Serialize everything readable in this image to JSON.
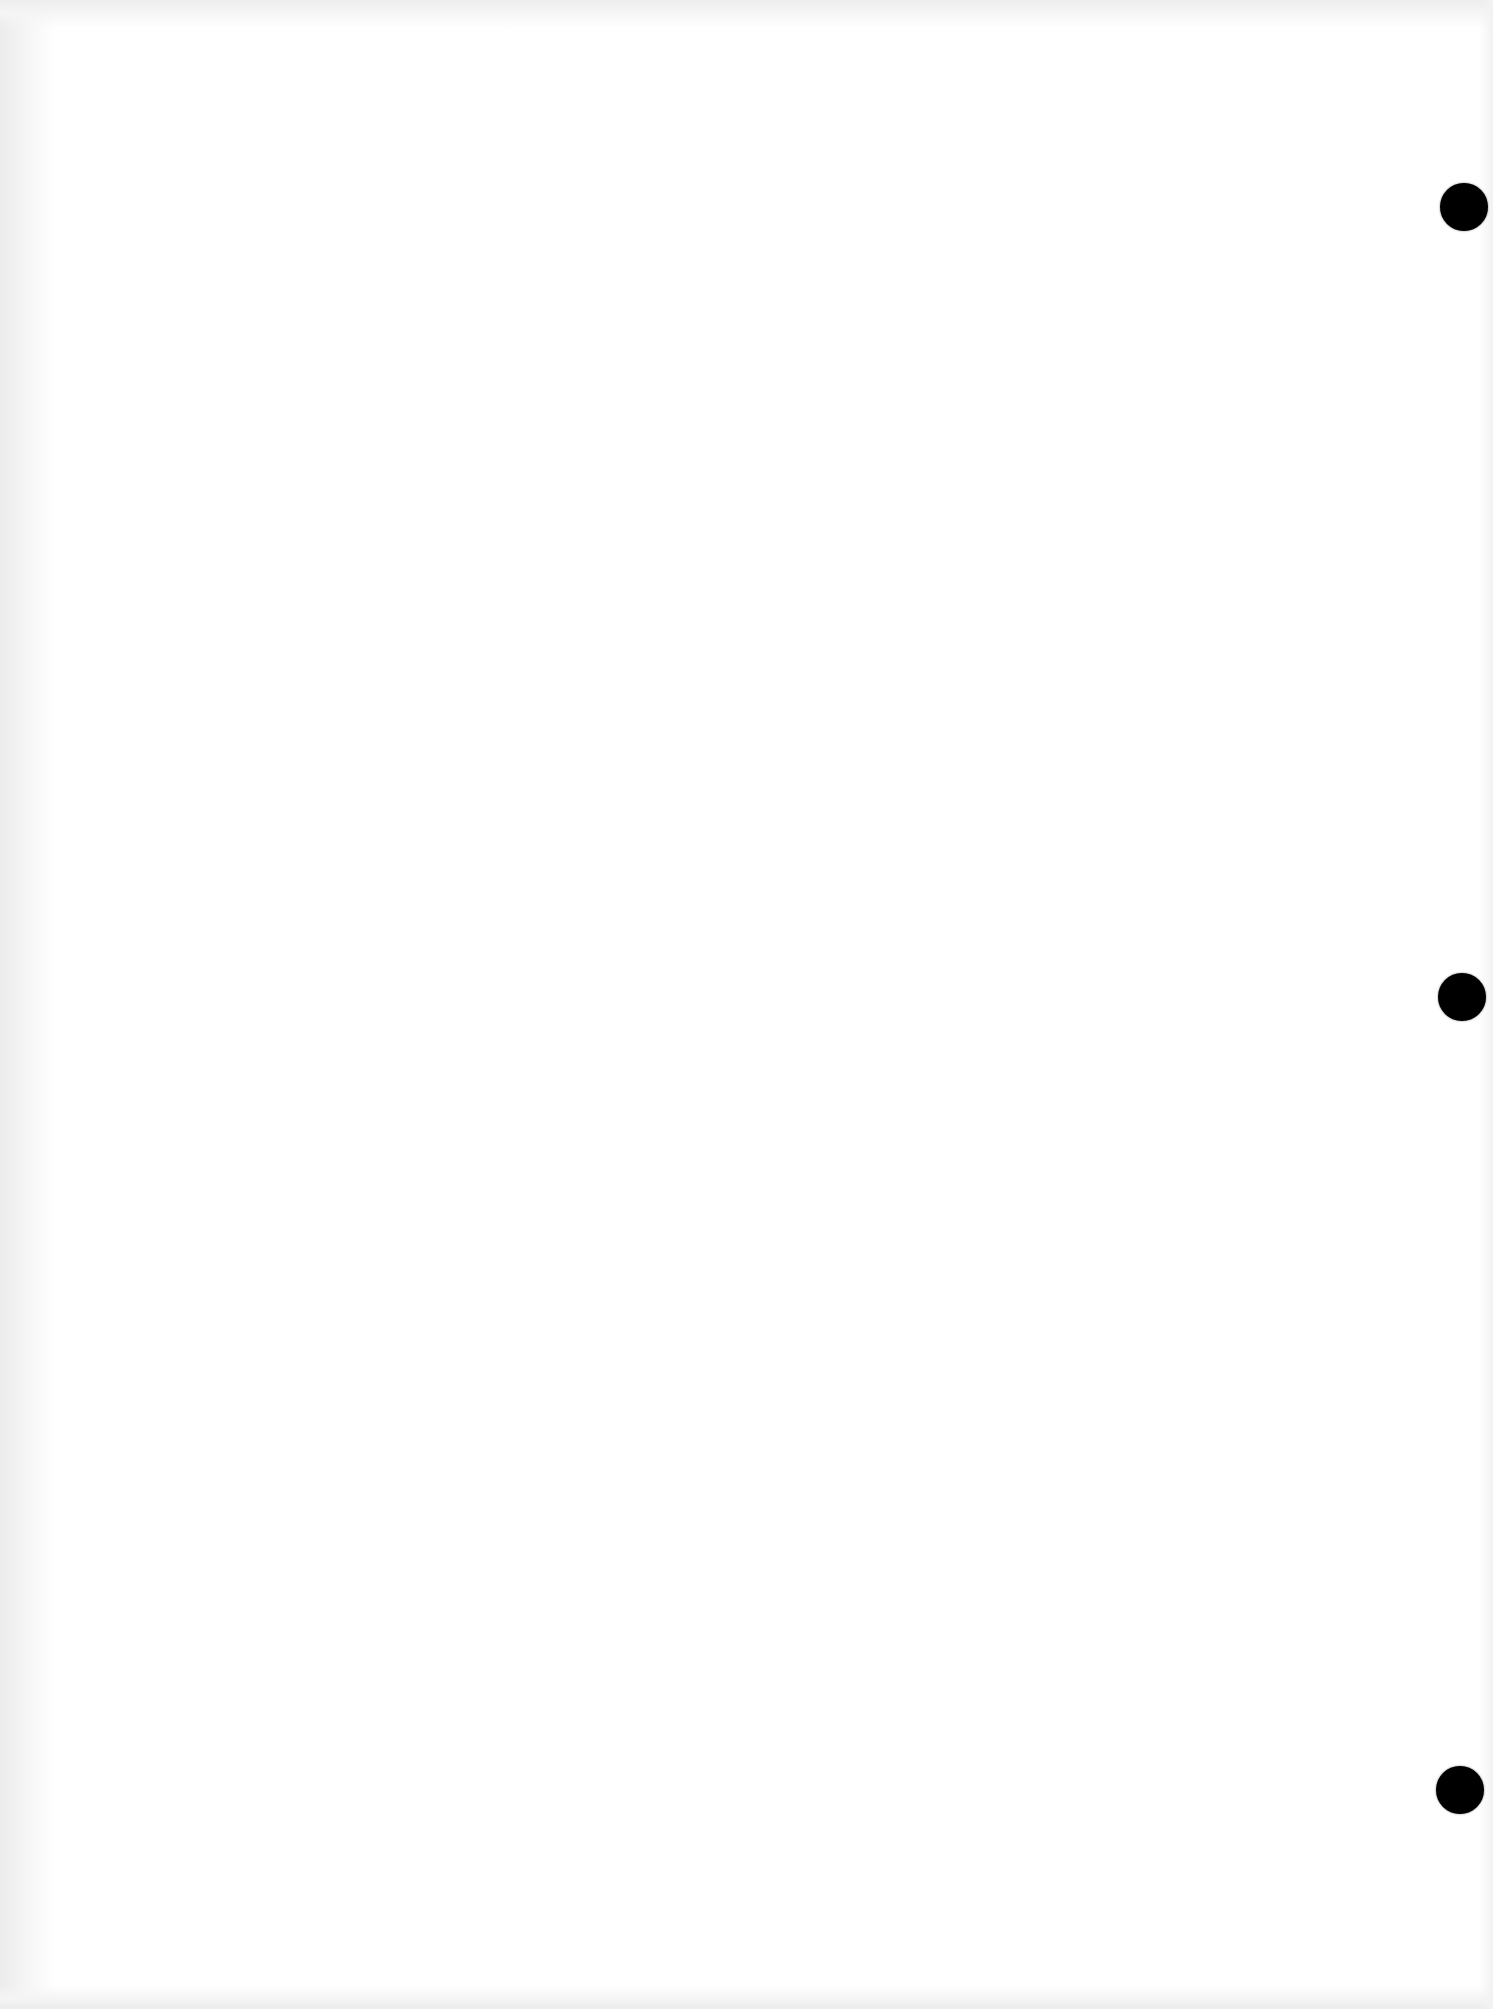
{
  "document": {
    "type": "scanned blank page",
    "text": "",
    "background_color": "#ffffff",
    "edge_shade_color": "#ececec"
  },
  "punch_holes": [
    {
      "cx": 1464,
      "cy": 207,
      "diameter": 48,
      "color": "#000000"
    },
    {
      "cx": 1462,
      "cy": 997,
      "diameter": 48,
      "color": "#000000"
    },
    {
      "cx": 1460,
      "cy": 1790,
      "diameter": 48,
      "color": "#000000"
    }
  ]
}
